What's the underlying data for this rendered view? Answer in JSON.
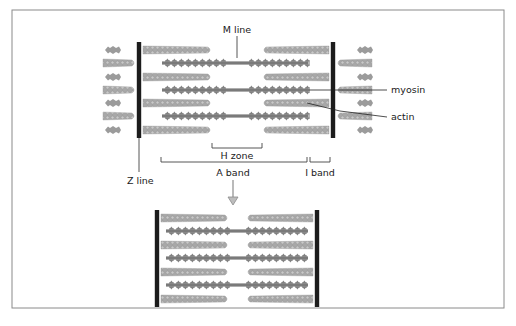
{
  "figure": {
    "frame": {
      "x": 12,
      "y": 10,
      "w": 492,
      "h": 298,
      "stroke": "#8a8a8a"
    }
  },
  "labels": {
    "m_line": "M line",
    "myosin": "myosin",
    "actin": "actin",
    "h_zone": "H zone",
    "a_band": "A band",
    "i_band": "I band",
    "z_line": "Z line"
  },
  "colors": {
    "z_line": "#1c1c1c",
    "actin": "#9a9a9a",
    "actin_bead": "#b8b8b8",
    "myosin": "#7a7a7a",
    "myosin_head": "#888888",
    "leader_line": "#222222",
    "bracket": "#444444",
    "arrow": "#8c8c8c"
  },
  "relaxed": {
    "z_left": 139,
    "z_right": 333,
    "z_top": 42,
    "z_bottom": 138,
    "actin_rows": [
      50,
      77,
      103,
      130
    ],
    "myosin_rows": [
      63,
      90,
      116
    ],
    "actin_left_span": [
      143,
      212
    ],
    "actin_right_span": [
      262,
      329
    ],
    "myosin_span": [
      162,
      308
    ],
    "outer_actin_rows": [
      63,
      90,
      116
    ],
    "outer_myosin_stubs": [
      50,
      77,
      103,
      130
    ]
  },
  "contracted": {
    "z_left": 157,
    "z_right": 317,
    "z_top": 210,
    "z_bottom": 307,
    "actin_rows": [
      218,
      245,
      272,
      299
    ],
    "myosin_rows": [
      231,
      258,
      285
    ],
    "actin_left_span": [
      161,
      229
    ],
    "actin_right_span": [
      246,
      313
    ],
    "myosin_span": [
      166,
      308
    ]
  },
  "annotations": {
    "m_line_tick": {
      "x": 237,
      "y1": 36,
      "y2": 58
    },
    "h_zone": {
      "x1": 212,
      "x2": 262,
      "y": 148
    },
    "a_band": {
      "x1": 161,
      "x2": 307,
      "y": 162
    },
    "i_band": {
      "x1": 310,
      "x2": 330,
      "y": 162
    },
    "z_line_leader": {
      "x": 139,
      "y1": 138,
      "y2": 172
    },
    "arrow": {
      "x": 233,
      "y1": 180,
      "y2": 205
    }
  }
}
